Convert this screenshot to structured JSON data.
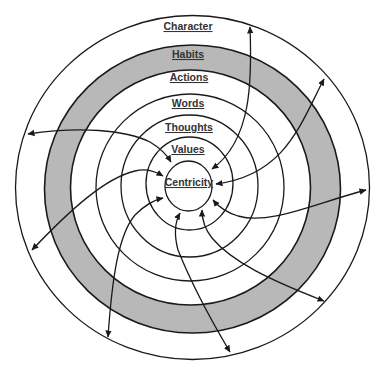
{
  "diagram": {
    "title": "",
    "center": {
      "cx": 190,
      "cy": 187
    },
    "rings": [
      {
        "name": "Character",
        "rx": 177,
        "ry": 172,
        "cx": 192.5,
        "cy": 187.5,
        "fill": "#ffffff"
      },
      {
        "name": "Habits",
        "rx": 148,
        "ry": 144,
        "cx": 192.5,
        "cy": 189,
        "fill": "#b8b8b8"
      },
      {
        "name": "Actions",
        "rx": 120,
        "ry": 117.5,
        "cx": 190.5,
        "cy": 187.5,
        "fill": "#ffffff"
      },
      {
        "name": "Words",
        "rx": 94,
        "ry": 93.5,
        "cx": 190,
        "cy": 187.5,
        "fill": "#ffffff"
      },
      {
        "name": "Thoughts",
        "rx": 68.5,
        "ry": 71,
        "cx": 189.5,
        "cy": 186,
        "fill": "#ffffff"
      },
      {
        "name": "Values",
        "rx": 43.5,
        "ry": 46.5,
        "cx": 189.5,
        "cy": 183.5,
        "fill": "#ffffff"
      },
      {
        "name": "Centricity",
        "rx": 23.5,
        "ry": 25,
        "cx": 188.5,
        "cy": 186,
        "fill": "#ffffff"
      }
    ],
    "labels": {
      "character": "Character",
      "habits": "Habits",
      "actions": "Actions",
      "words": "Words",
      "thoughts": "Thoughts",
      "values": "Values",
      "centricity": "Centricity"
    },
    "label_positions": {
      "character": {
        "x": 188,
        "y": 30
      },
      "habits": {
        "x": 188,
        "y": 58
      },
      "actions": {
        "x": 189,
        "y": 81
      },
      "words": {
        "x": 188,
        "y": 107
      },
      "thoughts": {
        "x": 189,
        "y": 131
      },
      "values": {
        "x": 188,
        "y": 153
      },
      "centricity": {
        "x": 189,
        "y": 186
      }
    },
    "arrows": [
      {
        "id": "arrow-top",
        "from": [
          250,
          27
        ],
        "to": [
          212,
          169
        ],
        "double_headed": true
      },
      {
        "id": "arrow-upper-right",
        "from": [
          324,
          79
        ],
        "to": [
          216,
          184
        ],
        "double_headed": true
      },
      {
        "id": "arrow-right",
        "from": [
          366,
          190
        ],
        "to": [
          213,
          200
        ],
        "double_headed": true
      },
      {
        "id": "arrow-lower-right",
        "from": [
          324,
          301
        ],
        "to": [
          202,
          210
        ],
        "double_headed": true
      },
      {
        "id": "arrow-bottom",
        "from": [
          230,
          352
        ],
        "to": [
          180,
          213
        ],
        "double_headed": true
      },
      {
        "id": "arrow-lower-left",
        "from": [
          108,
          337
        ],
        "to": [
          163,
          198
        ],
        "double_headed": true
      },
      {
        "id": "arrow-left",
        "from": [
          32,
          250
        ],
        "to": [
          163,
          176
        ],
        "double_headed": true
      },
      {
        "id": "arrow-upper-left",
        "from": [
          28,
          134
        ],
        "to": [
          171,
          162
        ],
        "double_headed": true
      }
    ],
    "colors": {
      "line": "#1a1a1a",
      "band": "#b8b8b8",
      "background": "#ffffff",
      "text": "#333333"
    }
  }
}
